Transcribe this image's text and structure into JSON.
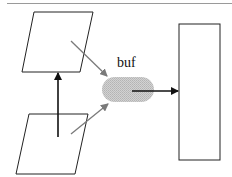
{
  "diagram": {
    "title": "",
    "nodes": [
      {
        "id": "top-source",
        "shape": "parallelogram",
        "label": ""
      },
      {
        "id": "bottom-source",
        "shape": "parallelogram",
        "label": ""
      },
      {
        "id": "buffer",
        "shape": "rounded-pill",
        "label": "buf",
        "fill": "#c8c8c8"
      },
      {
        "id": "sink",
        "shape": "rectangle",
        "label": ""
      }
    ],
    "edges": [
      {
        "from": "bottom-source",
        "to": "top-source",
        "color": "#111111",
        "style": "solid"
      },
      {
        "from": "top-source",
        "to": "buffer",
        "color": "#777777",
        "style": "solid"
      },
      {
        "from": "bottom-source",
        "to": "buffer",
        "color": "#777777",
        "style": "solid"
      },
      {
        "from": "buffer",
        "to": "sink",
        "color": "#111111",
        "style": "solid"
      }
    ],
    "colors": {
      "stroke": "#222222",
      "gray_arrow": "#7a7a7a",
      "black_arrow": "#111111",
      "top_rule": "#9a9a9a",
      "buffer_fill": "#c8c8c8"
    }
  }
}
